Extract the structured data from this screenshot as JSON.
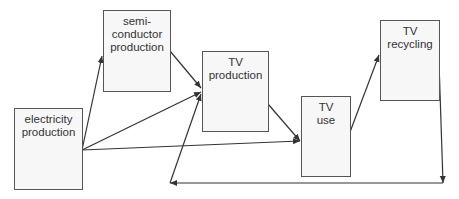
{
  "diagram": {
    "type": "flow",
    "nodes": [
      {
        "id": "semiconductor",
        "lines": [
          "semi-",
          "conductor",
          "production"
        ],
        "box": [
          103,
          10,
          68,
          82
        ]
      },
      {
        "id": "tv_production",
        "lines": [
          "TV",
          "production"
        ],
        "box": [
          202,
          51,
          67,
          81
        ]
      },
      {
        "id": "tv_use",
        "lines": [
          "TV",
          "use"
        ],
        "box": [
          301,
          96,
          50,
          81
        ]
      },
      {
        "id": "tv_recycling",
        "lines": [
          "TV",
          "recycling"
        ],
        "box": [
          380,
          20,
          60,
          81
        ]
      },
      {
        "id": "electricity",
        "lines": [
          "electricity",
          "production"
        ],
        "box": [
          14,
          108,
          69,
          82
        ]
      }
    ],
    "edges": [
      {
        "from": "electricity",
        "to": "semiconductor",
        "points": [
          [
            82,
            150
          ],
          [
            102,
            56
          ]
        ]
      },
      {
        "from": "electricity",
        "to": "tv_production",
        "points": [
          [
            82,
            150
          ],
          [
            201,
            92
          ]
        ]
      },
      {
        "from": "electricity",
        "to": "tv_use",
        "points": [
          [
            82,
            150
          ],
          [
            300,
            141
          ]
        ]
      },
      {
        "from": "semiconductor",
        "to": "tv_production",
        "points": [
          [
            170,
            51
          ],
          [
            201,
            88
          ]
        ]
      },
      {
        "from": "tv_production",
        "to": "tv_use",
        "points": [
          [
            268,
            104
          ],
          [
            300,
            141
          ]
        ]
      },
      {
        "from": "tv_use",
        "to": "tv_recycling",
        "points": [
          [
            350,
            132
          ],
          [
            379,
            55
          ]
        ]
      },
      {
        "from": "tv_recycling",
        "to": "bottom_return",
        "points": [
          [
            439,
            62
          ],
          [
            443,
            183
          ]
        ]
      },
      {
        "from": "bottom_return_right",
        "to": "bottom_return_left",
        "points": [
          [
            443,
            183
          ],
          [
            170,
            183
          ]
        ]
      },
      {
        "from": "bottom_return_left",
        "to": "tv_production",
        "points": [
          [
            170,
            183
          ],
          [
            201,
            94
          ]
        ]
      }
    ],
    "colors": {
      "line": "#333333",
      "box_border": "#555555",
      "box_fill": "#f7f7f7",
      "text": "#333333"
    }
  }
}
